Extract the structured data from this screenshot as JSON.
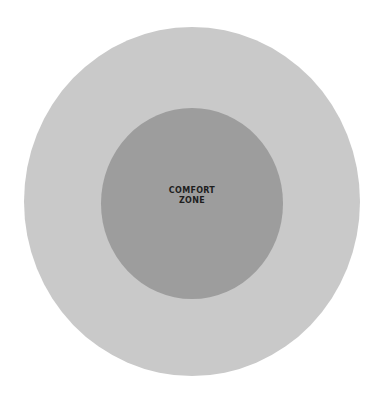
{
  "diagram": {
    "type": "concentric-circles",
    "outer_circle": {
      "label": "",
      "color": "#c9c9c9"
    },
    "inner_circle": {
      "label_line1": "COMFORT",
      "label_line2": "ZONE",
      "color": "#9d9d9d"
    }
  }
}
